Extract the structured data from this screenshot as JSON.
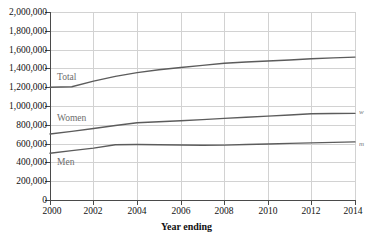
{
  "chart_data": {
    "type": "line",
    "title": "",
    "xlabel": "Year ending",
    "ylabel": "",
    "x": [
      2000,
      2001,
      2002,
      2003,
      2004,
      2005,
      2006,
      2007,
      2008,
      2009,
      2010,
      2011,
      2012,
      2013,
      2014
    ],
    "xlim": [
      2000,
      2014
    ],
    "ylim": [
      0,
      2000000
    ],
    "xticks": [
      "2000",
      "2002",
      "2004",
      "2006",
      "2008",
      "2010",
      "2012",
      "2014"
    ],
    "yticks": [
      "2,000,000",
      "1,800,000",
      "1,600,000",
      "1,400,000",
      "1,200,000",
      "1,000,000",
      "800,000",
      "600,000",
      "400,000",
      "200,000",
      "0"
    ],
    "grid": true,
    "legend_position": "inline-labels",
    "series": [
      {
        "name": "Total",
        "label": "Total",
        "color": "#5c5c5c",
        "values": [
          1200000,
          1205000,
          1265000,
          1315000,
          1355000,
          1385000,
          1410000,
          1432000,
          1455000,
          1468000,
          1478000,
          1490000,
          1502000,
          1512000,
          1520000
        ]
      },
      {
        "name": "Women",
        "label": "Women",
        "color": "#5c5c5c",
        "values": [
          702000,
          730000,
          760000,
          793000,
          822000,
          833000,
          843000,
          855000,
          868000,
          880000,
          892000,
          905000,
          917000,
          920000,
          922000
        ]
      },
      {
        "name": "Men",
        "label": "Men",
        "color": "#5c5c5c",
        "values": [
          498000,
          525000,
          552000,
          588000,
          590000,
          588000,
          585000,
          583000,
          584000,
          590000,
          596000,
          602000,
          608000,
          613000,
          618000
        ]
      }
    ],
    "edge_markers": [
      {
        "name": "women-marker",
        "text": "w"
      },
      {
        "name": "men-marker",
        "text": "m"
      }
    ]
  }
}
